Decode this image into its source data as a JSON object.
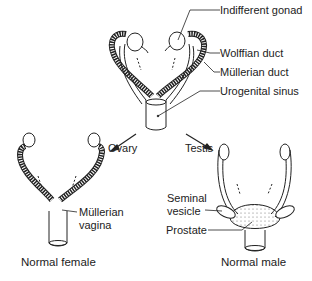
{
  "diagram": {
    "top_labels": {
      "indifferent_gonad": "Indifferent gonad",
      "wolffian_duct": "Wolffian duct",
      "mullerian_duct": "Müllerian duct",
      "urogenital_sinus": "Urogenital sinus"
    },
    "branches": {
      "ovary": "Ovary",
      "testis": "Testis"
    },
    "female": {
      "mullerian_vagina_line1": "Müllerian",
      "mullerian_vagina_line2": "vagina",
      "caption": "Normal female"
    },
    "male": {
      "seminal_vesicle_line1": "Seminal",
      "seminal_vesicle_line2": "vesicle",
      "prostate": "Prostate",
      "caption": "Normal male"
    }
  }
}
